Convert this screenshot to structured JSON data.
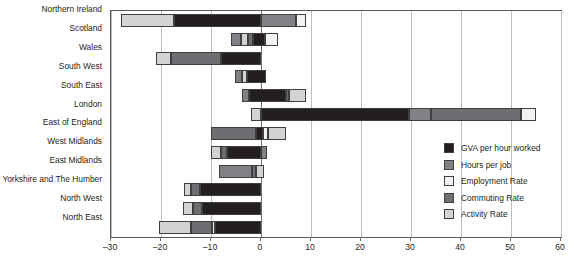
{
  "chart_data": {
    "type": "bar",
    "orientation": "horizontal",
    "stacked": true,
    "title": "",
    "subtitle": "",
    "xlabel": "",
    "ylabel": "",
    "xlim": [
      -30,
      60
    ],
    "xticks": [
      -30,
      -20,
      -10,
      0,
      10,
      20,
      30,
      40,
      50,
      60
    ],
    "xtick_labels": [
      "–30",
      "–20",
      "–10",
      "0",
      "10",
      "20",
      "30",
      "40",
      "50",
      "60"
    ],
    "grid": "vertical",
    "legend_position": "middle-right",
    "categories": [
      "Northern Ireland",
      "Scotland",
      "Wales",
      "South West",
      "South East",
      "London",
      "East of England",
      "West Midlands",
      "East Midlands",
      "Yorkshire and The Humber",
      "North West",
      "North East"
    ],
    "series": [
      {
        "name": "GVA per hour worked",
        "color": "#231f20",
        "values": [
          -17.4,
          -1.6,
          -8.0,
          -2.8,
          5.0,
          29.6,
          1.0,
          -6.8,
          -6.4,
          -12.2,
          -11.8,
          -9.2
        ]
      },
      {
        "name": "Hours per job",
        "color": "#808285",
        "values": [
          2.2,
          -1.6,
          2.4,
          -1.0,
          -1.0,
          5.0,
          -4.0,
          1.2,
          1.8,
          0.0,
          0.0,
          0.0
        ]
      },
      {
        "name": "Employment Rate",
        "color": "#f1f2f2",
        "values": [
          1.8,
          1.4,
          0.0,
          0.0,
          4.0,
          0.0,
          0.6,
          0.0,
          0.0,
          0.0,
          0.0,
          0.6
        ]
      },
      {
        "name": "Commuting Rate",
        "color": "#6d6e71",
        "values": [
          0.0,
          -1.0,
          -3.0,
          -1.4,
          -0.4,
          19.6,
          -3.2,
          -1.2,
          -0.6,
          -1.8,
          -1.8,
          -4.4
        ]
      },
      {
        "name": "Activity Rate",
        "color": "#d1d3d4",
        "values": [
          -10.6,
          2.2,
          -2.2,
          -0.8,
          0.4,
          3.0,
          2.4,
          -2.0,
          -1.4,
          -1.4,
          -2.0,
          -6.4
        ]
      }
    ],
    "bars": [
      {
        "category": "Northern Ireland",
        "segments": [
          {
            "series": "Activity Rate",
            "start": -28.0,
            "end": -17.4
          },
          {
            "series": "GVA per hour worked",
            "start": -17.4,
            "end": 0.0
          },
          {
            "series": "Hours per job",
            "start": 0.0,
            "end": 7.0
          },
          {
            "series": "Employment Rate",
            "start": 7.0,
            "end": 9.0
          }
        ]
      },
      {
        "category": "Scotland",
        "segments": [
          {
            "series": "Hours per job",
            "start": -6.0,
            "end": -4.0
          },
          {
            "series": "Activity Rate",
            "start": -4.0,
            "end": -2.6
          },
          {
            "series": "Commuting Rate",
            "start": -2.6,
            "end": -1.6
          },
          {
            "series": "GVA per hour worked",
            "start": -1.6,
            "end": 0.8
          },
          {
            "series": "Employment Rate",
            "start": 0.8,
            "end": 3.4
          }
        ]
      },
      {
        "category": "Wales",
        "segments": [
          {
            "series": "Activity Rate",
            "start": -21.0,
            "end": -18.0
          },
          {
            "series": "Commuting Rate",
            "start": -18.0,
            "end": -8.0
          },
          {
            "series": "GVA per hour worked",
            "start": -8.0,
            "end": 0.0
          }
        ]
      },
      {
        "category": "South West",
        "segments": [
          {
            "series": "Hours per job",
            "start": -5.2,
            "end": -3.8
          },
          {
            "series": "Activity Rate",
            "start": -3.8,
            "end": -2.8
          },
          {
            "series": "GVA per hour worked",
            "start": -2.8,
            "end": 1.0
          }
        ]
      },
      {
        "category": "South East",
        "segments": [
          {
            "series": "Hours per job",
            "start": -3.8,
            "end": -2.4
          },
          {
            "series": "GVA per hour worked",
            "start": -2.4,
            "end": 5.0
          },
          {
            "series": "Commuting Rate",
            "start": 5.0,
            "end": 5.6
          },
          {
            "series": "Activity Rate",
            "start": 5.6,
            "end": 9.0
          }
        ]
      },
      {
        "category": "London",
        "segments": [
          {
            "series": "Activity Rate",
            "start": -2.0,
            "end": 0.0
          },
          {
            "series": "GVA per hour worked",
            "start": 0.0,
            "end": 29.6
          },
          {
            "series": "Hours per job",
            "start": 29.6,
            "end": 34.0
          },
          {
            "series": "Commuting Rate",
            "start": 34.0,
            "end": 52.0
          },
          {
            "series": "Employment Rate",
            "start": 52.0,
            "end": 55.0
          }
        ]
      },
      {
        "category": "East of England",
        "segments": [
          {
            "series": "Commuting Rate",
            "start": -10.0,
            "end": -1.0
          },
          {
            "series": "GVA per hour worked",
            "start": -1.0,
            "end": 0.4
          },
          {
            "series": "Employment Rate",
            "start": 0.4,
            "end": 1.4
          },
          {
            "series": "Activity Rate",
            "start": 1.4,
            "end": 5.0
          }
        ]
      },
      {
        "category": "West Midlands",
        "segments": [
          {
            "series": "Activity Rate",
            "start": -10.0,
            "end": -8.0
          },
          {
            "series": "Commuting Rate",
            "start": -8.0,
            "end": -6.8
          },
          {
            "series": "GVA per hour worked",
            "start": -6.8,
            "end": 0.0
          },
          {
            "series": "Hours per job",
            "start": 0.0,
            "end": 1.2
          }
        ]
      },
      {
        "category": "East Midlands",
        "segments": [
          {
            "series": "Hours per job",
            "start": -8.4,
            "end": -1.8
          },
          {
            "series": "Commuting Rate",
            "start": -1.8,
            "end": -1.0
          },
          {
            "series": "Activity Rate",
            "start": -1.0,
            "end": 0.6
          }
        ]
      },
      {
        "category": "Yorkshire and The Humber",
        "segments": [
          {
            "series": "Activity Rate",
            "start": -15.4,
            "end": -14.0
          },
          {
            "series": "Commuting Rate",
            "start": -14.0,
            "end": -12.2
          },
          {
            "series": "GVA per hour worked",
            "start": -12.2,
            "end": 0.0
          }
        ]
      },
      {
        "category": "North West",
        "segments": [
          {
            "series": "Activity Rate",
            "start": -15.6,
            "end": -13.6
          },
          {
            "series": "Commuting Rate",
            "start": -13.6,
            "end": -11.8
          },
          {
            "series": "GVA per hour worked",
            "start": -11.8,
            "end": 0.0
          }
        ]
      },
      {
        "category": "North East",
        "segments": [
          {
            "series": "Activity Rate",
            "start": -20.4,
            "end": -14.0
          },
          {
            "series": "Commuting Rate",
            "start": -14.0,
            "end": -9.8
          },
          {
            "series": "Employment Rate",
            "start": -9.8,
            "end": -9.2
          },
          {
            "series": "GVA per hour worked",
            "start": -9.2,
            "end": 0.0
          }
        ]
      }
    ]
  },
  "legend": {
    "items": [
      {
        "label": "GVA per hour worked",
        "color": "#231f20"
      },
      {
        "label": "Hours per job",
        "color": "#808285"
      },
      {
        "label": "Employment Rate",
        "color": "#f1f2f2"
      },
      {
        "label": "Commuting Rate",
        "color": "#6d6e71"
      },
      {
        "label": "Activity Rate",
        "color": "#d1d3d4"
      }
    ]
  },
  "colors": {
    "frame": "#58595b",
    "grid": "#bcbec0",
    "zero": "#6d6e71",
    "text": "#231f20",
    "background": "#ffffff",
    "segment_border": "#3f3f3f"
  }
}
